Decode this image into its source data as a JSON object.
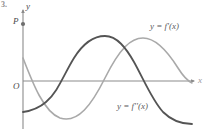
{
  "figure": {
    "problem_number": "3.",
    "width": 205,
    "height": 130
  },
  "axes": {
    "y_label": "y",
    "x_label": "x",
    "origin_label": "O",
    "x_axis_color": "#8b8b8b",
    "y_axis_color": "#8b8b8b",
    "x_axis_y": 81,
    "y_axis_x": 23,
    "x_axis_start": 23,
    "x_axis_end": 196,
    "y_axis_top": 8,
    "y_axis_bottom": 129
  },
  "points": [
    {
      "name": "P",
      "label": "P",
      "x": 23,
      "y": 24,
      "color": "#6e6e6e",
      "description": "marked point on the y-axis above the origin"
    }
  ],
  "chart_data": {
    "type": "line",
    "title": "",
    "xlabel": "x",
    "ylabel": "y",
    "grid": false,
    "legend": "inline-curve-labels",
    "xlim": [
      0,
      205
    ],
    "ylim": [
      130,
      0
    ],
    "series": [
      {
        "name": "y = f'(x)",
        "label": "y = f'(x)",
        "color": "#a9a9a9",
        "width": 1.6,
        "label_position": {
          "x": 150,
          "y": 22
        },
        "description": "lighter grey sinusoid: starts below the P-level, dips to a minimum near x=60, rises through the x-axis near x=100, peaks near x=143, then falls to the x-axis near x=186",
        "path": "M 23,58 C 33,84 44,112 60,118 C 78,124 92,104 105,78 C 120,48 131,38 143,38 C 156,38 168,52 178,68 C 183,76 188,81 192,83"
      },
      {
        "name": "y = f''(x)",
        "label": "y = f''(x)",
        "color": "#545454",
        "width": 1.8,
        "label_position": {
          "x": 117,
          "y": 102
        },
        "description": "darker grey sinusoid: starts low near y=112, rises through the x-axis near x=60, peaks near x=105, descends through the x-axis near x=143, and ends low near y=122",
        "path": "M 23,112 C 30,111 38,109 46,102 C 58,92 64,74 74,58 C 84,42 95,36 105,36 C 117,36 126,48 134,62 C 144,80 152,100 163,112 C 173,122 183,124 192,124"
      }
    ],
    "annotations": [
      {
        "text": "P",
        "x": 13,
        "y": 17,
        "kind": "point-label"
      },
      {
        "text": "O",
        "x": 13,
        "y": 82,
        "kind": "origin-label"
      }
    ]
  }
}
